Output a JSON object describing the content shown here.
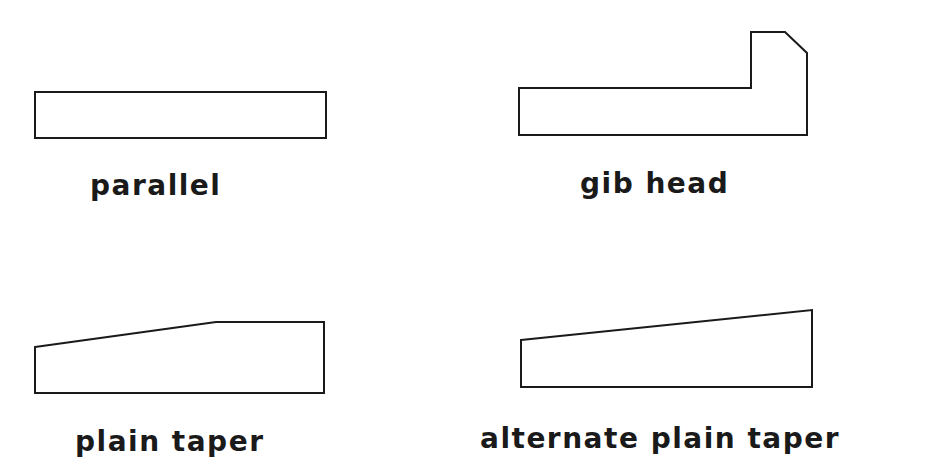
{
  "diagram": {
    "stroke_color": "#1a1a1a",
    "background": "#ffffff",
    "keys": [
      {
        "id": "parallel",
        "label": "parallel",
        "points": "35,92 326,92 326,138 35,138"
      },
      {
        "id": "gib-head",
        "label": "gib head",
        "points": "519,88 751,88 751,32 785,32 807,53 807,135 519,135"
      },
      {
        "id": "plain-taper",
        "label": "plain taper",
        "points": "35,347 216,322 324,322 324,393 35,393"
      },
      {
        "id": "alternate-plain-taper",
        "label": "alternate plain taper",
        "points": "521,340 812,310 812,387 521,387"
      }
    ]
  }
}
